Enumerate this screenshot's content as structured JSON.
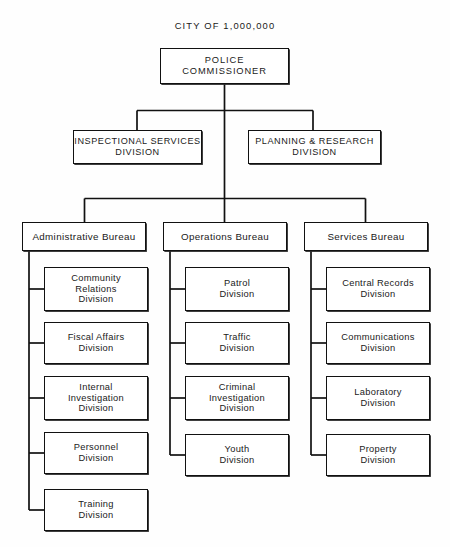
{
  "chart_title": "CITY OF 1,000,000",
  "colors": {
    "line": "#111111",
    "text": "#1a1a1a",
    "box_fill": "#ffffff",
    "page": "#fefefe"
  },
  "top": {
    "commissioner": "POLICE COMMISSIONER"
  },
  "staff": {
    "inspectional": "INSPECTIONAL SERVICES\nDIVISION",
    "planning": "PLANNING & RESEARCH\nDIVISION"
  },
  "bureaus": [
    {
      "name": "Administrative Bureau",
      "divisions": [
        "Community\nRelations\nDivision",
        "Fiscal Affairs\nDivision",
        "Internal\nInvestigation\nDivision",
        "Personnel\nDivision",
        "Training\nDivision"
      ]
    },
    {
      "name": "Operations Bureau",
      "divisions": [
        "Patrol\nDivision",
        "Traffic\nDivision",
        "Criminal\nInvestigation\nDivision",
        "Youth\nDivision"
      ]
    },
    {
      "name": "Services Bureau",
      "divisions": [
        "Central Records\nDivision",
        "Communications\nDivision",
        "Laboratory\nDivision",
        "Property\nDivision"
      ]
    }
  ]
}
